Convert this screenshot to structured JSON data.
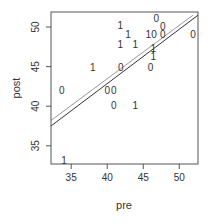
{
  "chart_data": {
    "type": "scatter",
    "title": "",
    "xlabel": "pre",
    "ylabel": "post",
    "xlim": [
      32.2,
      52.6
    ],
    "ylim": [
      32.7,
      51.9
    ],
    "xticks": [
      35,
      40,
      45,
      50
    ],
    "yticks": [
      35,
      40,
      45,
      50
    ],
    "grid": false,
    "legend": null,
    "marker": "text labels '0' and '1' (group indicator)",
    "points": [
      {
        "pre": 33.7,
        "post": 42.0,
        "label": "0"
      },
      {
        "pre": 38.0,
        "post": 45.0,
        "label": "1"
      },
      {
        "pre": 34.0,
        "post": 33.2,
        "label": "1"
      },
      {
        "pre": 41.8,
        "post": 50.2,
        "label": "1"
      },
      {
        "pre": 42.9,
        "post": 49.1,
        "label": "1"
      },
      {
        "pre": 41.8,
        "post": 47.9,
        "label": "1"
      },
      {
        "pre": 43.9,
        "post": 47.9,
        "label": "1"
      },
      {
        "pre": 41.9,
        "post": 45.0,
        "label": "0"
      },
      {
        "pre": 40.0,
        "post": 42.0,
        "label": "0"
      },
      {
        "pre": 40.9,
        "post": 42.0,
        "label": "0"
      },
      {
        "pre": 40.9,
        "post": 40.1,
        "label": "0"
      },
      {
        "pre": 43.9,
        "post": 40.1,
        "label": "1"
      },
      {
        "pre": 46.0,
        "post": 45.0,
        "label": "0"
      },
      {
        "pre": 46.4,
        "post": 47.3,
        "label": "1"
      },
      {
        "pre": 46.4,
        "post": 46.3,
        "label": "1"
      },
      {
        "pre": 45.7,
        "post": 49.1,
        "label": "1"
      },
      {
        "pre": 46.5,
        "post": 49.1,
        "label": "0"
      },
      {
        "pre": 46.8,
        "post": 51.1,
        "label": "0"
      },
      {
        "pre": 47.7,
        "post": 50.1,
        "label": "0"
      },
      {
        "pre": 47.7,
        "post": 49.1,
        "label": "0"
      },
      {
        "pre": 51.9,
        "post": 49.1,
        "label": "0"
      }
    ],
    "lines": [
      {
        "name": "fit-line-dark",
        "color": "#333333",
        "from": {
          "pre": 32.2,
          "post": 37.5
        },
        "to": {
          "pre": 52.6,
          "post": 51.5
        }
      },
      {
        "name": "fit-line-gray",
        "color": "#999999",
        "from": {
          "pre": 32.2,
          "post": 38.2
        },
        "to": {
          "pre": 51.9,
          "post": 51.5
        }
      }
    ]
  },
  "axes": {
    "x_label": "pre",
    "y_label": "post",
    "x_tick_labels": [
      "35",
      "40",
      "45",
      "50"
    ],
    "y_tick_labels": [
      "35",
      "40",
      "45",
      "50"
    ]
  },
  "colors": {
    "axis": "#555555",
    "text": "#333333",
    "line_dark": "#333333",
    "line_gray": "#999999"
  }
}
